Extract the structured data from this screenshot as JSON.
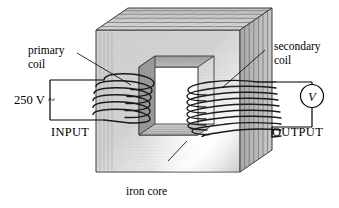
{
  "figure": {
    "background_color": "#ffffff",
    "line_color": "#000000"
  },
  "labels": {
    "primary_coil_line1": "primary",
    "primary_coil_line2": "coil",
    "secondary_coil_line1": "secondary",
    "secondary_coil_line2": "coil",
    "iron_core": "iron core",
    "input": "INPUT",
    "output": "OUTPUT",
    "supply_voltage": "250 V",
    "supply_ac_symbol": "~",
    "voltmeter": "V"
  },
  "core": {
    "name": "iron core",
    "fill_front": "#d3d3d3",
    "fill_top": "#cdcdcd",
    "fill_side": "#b4b4b4",
    "lamination_count_top": 6,
    "lamination_count_side": 7,
    "highlight": "specular-sheen-lower-right"
  },
  "coils": {
    "primary": {
      "name": "primary coil",
      "turns": 5,
      "side": "left",
      "wire_color": "#000000"
    },
    "secondary": {
      "name": "secondary coil",
      "turns": 9,
      "side": "right",
      "wire_color": "#000000"
    }
  },
  "circuits": {
    "input": {
      "label": "INPUT",
      "source_label": "250 V~",
      "side": "left"
    },
    "output": {
      "label": "OUTPUT",
      "meter_label": "V",
      "side": "right"
    }
  }
}
